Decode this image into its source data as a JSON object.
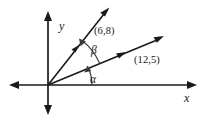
{
  "figure": {
    "background_color": "#ffffff",
    "stroke_color": "#1a1a1a",
    "arc_color": "#3a3a3a",
    "width": 205,
    "height": 119
  },
  "axes": {
    "x_label": "x",
    "y_label": "y",
    "origin": {
      "x": 48,
      "y": 85
    },
    "x_axis_left_end": 10,
    "x_axis_right_end": 196,
    "y_axis_top_end": 12,
    "y_axis_bottom_end": 114,
    "arrowheads": [
      "left",
      "right",
      "up",
      "down"
    ]
  },
  "vectors": [
    {
      "name": "vector-6-8",
      "label": "(6,8)",
      "components": {
        "x": 6,
        "y": 8
      },
      "tip": {
        "x": 109,
        "y": 10
      },
      "mid_arrow": true
    },
    {
      "name": "vector-12-5",
      "label": "(12,5)",
      "components": {
        "x": 12,
        "y": 5
      },
      "tip": {
        "x": 163,
        "y": 37
      },
      "mid_arrow": true
    }
  ],
  "angles": [
    {
      "name": "angle-alpha",
      "label": "α",
      "between": [
        "x-axis",
        "(12,5)"
      ],
      "arc_radius": 44
    },
    {
      "name": "angle-beta",
      "label": "β",
      "between": [
        "(12,5)",
        "(6,8)"
      ],
      "arc_radius": 56
    }
  ]
}
